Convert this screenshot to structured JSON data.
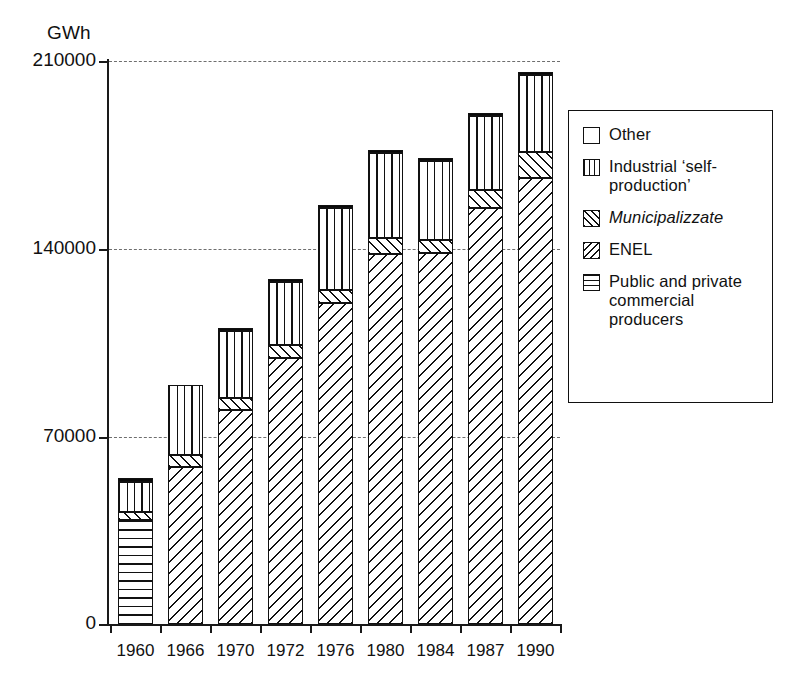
{
  "chart_data": {
    "type": "bar",
    "subtype": "stacked",
    "title": "",
    "xlabel": "",
    "ylabel": "GWh",
    "unit_label": "GWh",
    "categories": [
      "1960",
      "1966",
      "1970",
      "1972",
      "1976",
      "1980",
      "1984",
      "1987",
      "1990"
    ],
    "ylim": [
      0,
      210000
    ],
    "yticks": [
      0,
      70000,
      140000,
      210000
    ],
    "ytick_labels": [
      "0",
      "70000",
      "140000",
      "210000"
    ],
    "grid": "horizontal-dashed",
    "legend_position": "right",
    "series": [
      {
        "name": "Public and private commercial producers",
        "pattern": "horizontal-lines",
        "values": [
          38800,
          0,
          0,
          0,
          0,
          0,
          0,
          0,
          0
        ]
      },
      {
        "name": "ENEL",
        "pattern": "back-diagonal-hatch",
        "values": [
          0,
          58600,
          79800,
          99200,
          119700,
          138000,
          138400,
          155100,
          166300
        ]
      },
      {
        "name": "Municipalizzate",
        "pattern": "forward-diagonal-hatch",
        "values": [
          3000,
          4500,
          4500,
          4800,
          4800,
          6000,
          4800,
          6700,
          9700
        ]
      },
      {
        "name": "Industrial 'self-production'",
        "pattern": "vertical-lines",
        "values": [
          11200,
          26100,
          25000,
          23500,
          30600,
          31700,
          29500,
          27600,
          28700
        ]
      },
      {
        "name": "Other",
        "pattern": "solid-black",
        "values": [
          1500,
          0,
          1100,
          1200,
          1200,
          1100,
          1100,
          1100,
          1100
        ]
      }
    ],
    "totals": [
      54500,
      89200,
      110400,
      128700,
      156300,
      176800,
      173800,
      190500,
      205800
    ]
  },
  "legend": {
    "items": [
      {
        "label": "Other",
        "pattern": "solid-black",
        "italic": false
      },
      {
        "label": "Industrial ‘self-production’",
        "pattern": "vertical-lines",
        "italic": false
      },
      {
        "label": "Municipalizzate",
        "pattern": "forward-diagonal-hatch",
        "italic": true
      },
      {
        "label": "ENEL",
        "pattern": "back-diagonal-hatch",
        "italic": false
      },
      {
        "label": "Public and private commercial producers",
        "pattern": "horizontal-lines",
        "italic": false
      }
    ]
  },
  "colors": {
    "ink": "#111111",
    "background": "#ffffff",
    "gridline": "#555555"
  }
}
